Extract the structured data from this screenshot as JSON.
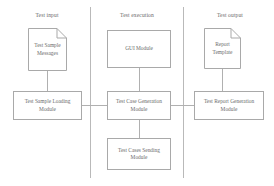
{
  "diagram": {
    "lanes": [
      {
        "id": "test-input",
        "label": "Test input"
      },
      {
        "id": "test-execution",
        "label": "Test execution"
      },
      {
        "id": "test-output",
        "label": "Test output"
      }
    ],
    "nodes": [
      {
        "id": "test-sample-messages",
        "label": "Test Sample Messages",
        "shape": "document"
      },
      {
        "id": "test-sample-loading-module",
        "label": "Test Sample Loading Module",
        "shape": "process"
      },
      {
        "id": "gui-module",
        "label": "GUI Module",
        "shape": "process"
      },
      {
        "id": "test-case-generation-module",
        "label": "Test Case Generation Module",
        "shape": "process"
      },
      {
        "id": "test-cases-sending-module",
        "label": "Test Cases Sending Module",
        "shape": "process"
      },
      {
        "id": "report-template",
        "label": "Report Template",
        "shape": "document"
      },
      {
        "id": "test-report-generation-module",
        "label": "Test Report Generation Module",
        "shape": "process"
      }
    ],
    "edges": [
      {
        "from": "test-sample-messages",
        "to": "test-sample-loading-module"
      },
      {
        "from": "test-sample-loading-module",
        "to": "test-case-generation-module"
      },
      {
        "from": "gui-module",
        "to": "test-case-generation-module"
      },
      {
        "from": "test-case-generation-module",
        "to": "test-cases-sending-module"
      },
      {
        "from": "test-case-generation-module",
        "to": "test-report-generation-module"
      },
      {
        "from": "report-template",
        "to": "test-report-generation-module"
      }
    ],
    "colors": {
      "stroke": "#a9a9a9",
      "divider": "#b9b9b9",
      "connector": "#b0b0b0",
      "text": "#6b6b6b",
      "background": "#ffffff"
    }
  }
}
